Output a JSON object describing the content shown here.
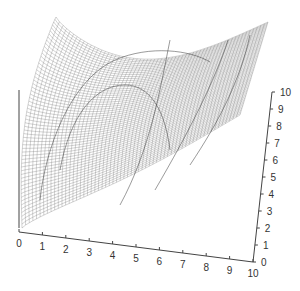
{
  "chart_data": {
    "type": "surface",
    "title": "",
    "xlabel": "",
    "ylabel": "",
    "zlabel": "",
    "x_ticks": [
      "0",
      "1",
      "2",
      "3",
      "4",
      "5",
      "6",
      "7",
      "8",
      "9",
      "10"
    ],
    "y_ticks": [
      "0",
      "1",
      "2",
      "3",
      "4",
      "5",
      "6",
      "7",
      "8",
      "9",
      "10"
    ],
    "xlim": [
      0,
      10
    ],
    "ylim": [
      0,
      10
    ],
    "grid": false,
    "legend": null,
    "mesh_color": "#555555",
    "contour_color": "#333333"
  },
  "colors": {
    "background": "#ffffff",
    "axis": "#333333"
  }
}
